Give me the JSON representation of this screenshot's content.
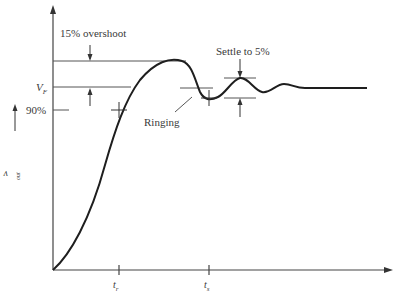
{
  "diagram": {
    "annotations": {
      "overshoot": "15% overshoot",
      "final_value": "V",
      "final_value_sub": "F",
      "ninety_percent": "90%",
      "ringing": "Ringing",
      "settle": "Settle to 5%"
    },
    "axes": {
      "y_label": "v",
      "y_label_sub": "out",
      "x_label": "Time",
      "x_ticks": [
        {
          "label": "t",
          "sub": "r"
        },
        {
          "label": "t",
          "sub": "s"
        }
      ]
    },
    "colors": {
      "line": "#2a2a2a",
      "curve": "#1e1e1e",
      "background": "#ffffff"
    }
  }
}
